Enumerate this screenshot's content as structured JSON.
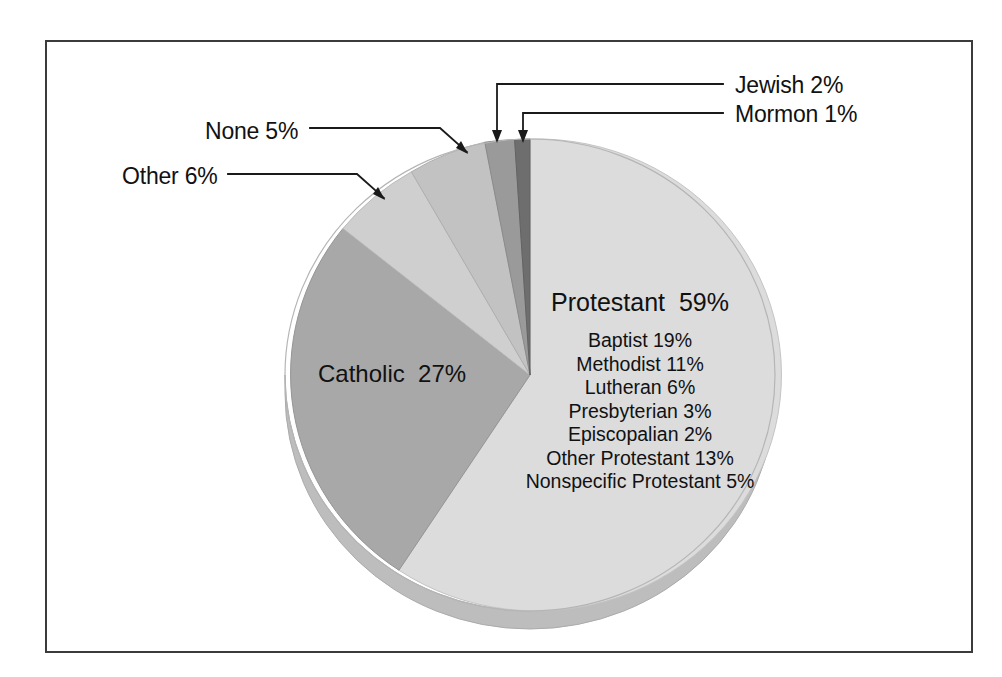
{
  "chart_data": {
    "type": "pie",
    "title": "",
    "subtitle": "",
    "xlabel": "",
    "ylabel": "",
    "legend_position": "none",
    "grid": false,
    "units": "percent",
    "categories": [
      "Protestant",
      "Catholic",
      "Other",
      "None",
      "Jewish",
      "Mormon"
    ],
    "values": [
      59,
      27,
      6,
      5,
      2,
      1
    ],
    "slices": [
      {
        "label": "Protestant",
        "value": 59,
        "display": "Protestant  59%",
        "color": "#dcdcdc",
        "label_placement": "inside"
      },
      {
        "label": "Catholic",
        "value": 27,
        "display": "Catholic  27%",
        "color": "#a8a8a8",
        "label_placement": "inside"
      },
      {
        "label": "Other",
        "value": 6,
        "display": "Other 6%",
        "color": "#cfcfcf",
        "label_placement": "callout-left"
      },
      {
        "label": "None",
        "value": 5,
        "display": "None 5%",
        "color": "#c2c2c2",
        "label_placement": "callout-left"
      },
      {
        "label": "Jewish",
        "value": 2,
        "display": "Jewish 2%",
        "color": "#9a9a9a",
        "label_placement": "callout-right"
      },
      {
        "label": "Mormon",
        "value": 1,
        "display": "Mormon 1%",
        "color": "#6e6e6e",
        "label_placement": "callout-right"
      }
    ],
    "breakdown": {
      "parent": "Protestant",
      "parent_value": 59,
      "items": [
        {
          "label": "Baptist",
          "value": 19,
          "display": "Baptist 19%"
        },
        {
          "label": "Methodist",
          "value": 11,
          "display": "Methodist 11%"
        },
        {
          "label": "Lutheran",
          "value": 6,
          "display": "Lutheran 6%"
        },
        {
          "label": "Presbyterian",
          "value": 3,
          "display": "Presbyterian 3%"
        },
        {
          "label": "Episcopalian",
          "value": 2,
          "display": "Episcopalian 2%"
        },
        {
          "label": "Other Protestant",
          "value": 13,
          "display": "Other Protestant 13%"
        },
        {
          "label": "Nonspecific Protestant",
          "value": 5,
          "display": "Nonspecific Protestant 5%"
        }
      ]
    }
  },
  "labels": {
    "protestant_main": "Protestant  59%",
    "catholic": "Catholic  27%",
    "none": "None 5%",
    "other": "Other 6%",
    "jewish": "Jewish 2%",
    "mormon": "Mormon 1%"
  },
  "breakdown_rows": [
    "Baptist 19%",
    "Methodist 11%",
    "Lutheran 6%",
    "Presbyterian 3%",
    "Episcopalian 2%",
    "Other Protestant 13%",
    "Nonspecific Protestant 5%"
  ],
  "colors": {
    "frame_border": "#3b3b3b",
    "background": "#ffffff",
    "text": "#111111",
    "leader_line": "#1a1a1a",
    "protestant": "#dcdcdc",
    "catholic": "#a8a8a8",
    "other": "#cfcfcf",
    "none": "#c2c2c2",
    "jewish": "#9a9a9a",
    "mormon": "#6e6e6e",
    "pie_depth": "#b9b9b9",
    "slice_edge": "#b0b0b0"
  }
}
